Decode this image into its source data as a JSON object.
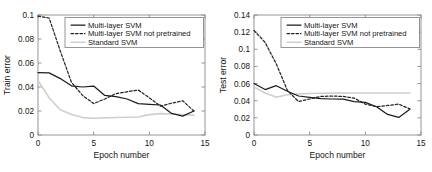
{
  "figure": {
    "background": "#ffffff",
    "panel_count": 2
  },
  "colors": {
    "multi_layer_svm": "#1c1c1c",
    "multi_layer_svm_not_pretrained": "#262626",
    "standard_svm": "#cfcfcf",
    "axis": "#8a8a8a",
    "text": "#141414"
  },
  "chart_data": [
    {
      "id": "train-error-chart",
      "type": "line",
      "title": "",
      "xlabel": "Epoch number",
      "ylabel": "Train error",
      "xlim": [
        0,
        15
      ],
      "ylim": [
        0,
        0.1
      ],
      "xticks": [
        0,
        5,
        10,
        15
      ],
      "xtick_labels": [
        "0",
        "5",
        "10",
        "15"
      ],
      "yticks": [
        0,
        0.02,
        0.04,
        0.06,
        0.08,
        0.1
      ],
      "ytick_labels": [
        "0",
        "0.02",
        "0.04",
        "0.06",
        "0.08",
        "0.1"
      ],
      "grid": false,
      "legend_position": "top-right",
      "x": [
        0,
        1,
        2,
        3,
        4,
        5,
        6,
        7,
        8,
        9,
        10,
        11,
        12,
        13,
        14
      ],
      "series": [
        {
          "name": "Multi-layer SVM",
          "style": "solid",
          "color": "#1c1c1c",
          "values": [
            0.052,
            0.0518,
            0.047,
            0.041,
            0.04,
            0.0408,
            0.033,
            0.032,
            0.03,
            0.0262,
            0.0255,
            0.025,
            0.018,
            0.0157,
            0.02
          ]
        },
        {
          "name": "Multi-layer SVM not pretrained",
          "style": "dashed",
          "color": "#262626",
          "values": [
            0.099,
            0.0975,
            0.07,
            0.044,
            0.033,
            0.0262,
            0.03,
            0.0345,
            0.036,
            0.0375,
            0.031,
            0.024,
            0.0265,
            0.0285,
            0.02
          ]
        },
        {
          "name": "Standard SVM",
          "style": "light-gray",
          "color": "#cfcfcf",
          "values": [
            0.0455,
            0.031,
            0.021,
            0.017,
            0.0145,
            0.014,
            0.0143,
            0.0146,
            0.0148,
            0.015,
            0.017,
            0.0178,
            0.0175,
            0.017,
            0.0166
          ]
        }
      ]
    },
    {
      "id": "test-error-chart",
      "type": "line",
      "title": "",
      "xlabel": "Epoch number",
      "ylabel": "Test error",
      "xlim": [
        0,
        15
      ],
      "ylim": [
        0,
        0.14
      ],
      "xticks": [
        0,
        5,
        10,
        15
      ],
      "xtick_labels": [
        "0",
        "5",
        "10",
        "15"
      ],
      "yticks": [
        0,
        0.02,
        0.04,
        0.06,
        0.08,
        0.1,
        0.12,
        0.14
      ],
      "ytick_labels": [
        "0",
        "0.02",
        "0.04",
        "0.06",
        "0.08",
        "0.1",
        "0.12",
        "0.14"
      ],
      "grid": false,
      "legend_position": "top-right",
      "x": [
        0,
        1,
        2,
        3,
        4,
        5,
        6,
        7,
        8,
        9,
        10,
        11,
        12,
        13,
        14
      ],
      "series": [
        {
          "name": "Multi-layer SVM",
          "style": "solid",
          "color": "#1c1c1c",
          "values": [
            0.06,
            0.053,
            0.0575,
            0.051,
            0.0455,
            0.044,
            0.0425,
            0.042,
            0.0418,
            0.039,
            0.038,
            0.033,
            0.024,
            0.0205,
            0.03
          ]
        },
        {
          "name": "Multi-layer SVM not pretrained",
          "style": "dashed",
          "color": "#262626",
          "values": [
            0.122,
            0.108,
            0.083,
            0.052,
            0.039,
            0.042,
            0.045,
            0.0455,
            0.045,
            0.043,
            0.036,
            0.033,
            0.0345,
            0.036,
            0.0305
          ]
        },
        {
          "name": "Standard SVM",
          "style": "light-gray",
          "color": "#cfcfcf",
          "values": [
            0.056,
            0.049,
            0.044,
            0.047,
            0.048,
            0.0485,
            0.0487,
            0.0488,
            0.0489,
            0.049,
            0.049,
            0.049,
            0.049,
            0.049,
            0.049
          ]
        }
      ]
    }
  ]
}
